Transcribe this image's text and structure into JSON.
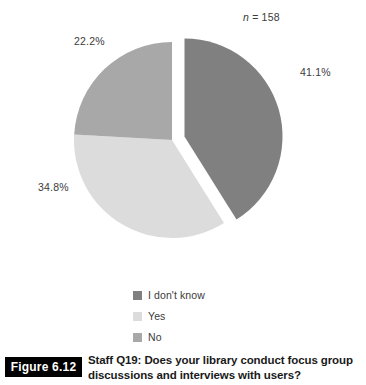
{
  "figure": {
    "tag_label": "Figure 6.12",
    "caption_line1": "Staff Q19: Does your library conduct focus group",
    "caption_line2": "discussions and interviews with users?"
  },
  "annotations": {
    "sample_size_prefix": "n",
    "sample_size_equals": "= 158",
    "sample_size_full": "n = 158"
  },
  "legend": {
    "items": [
      {
        "label": "I don't know",
        "color": "#808080"
      },
      {
        "label": "Yes",
        "color": "#dcdcdc"
      },
      {
        "label": "No",
        "color": "#a8a8a8"
      }
    ]
  },
  "labels": {
    "idk_pct": "41.1%",
    "yes_pct": "34.8%",
    "no_pct": "22.2%"
  },
  "chart_data": {
    "type": "pie",
    "title": "Staff Q19: Does your library conduct focus group discussions and interviews with users?",
    "subtitle": "n = 158",
    "sample_size": 158,
    "xlabel": "",
    "ylabel": "",
    "grid": false,
    "legend_position": "bottom",
    "start_angle_deg": 0,
    "direction": "clockwise",
    "exploded_slice": "I don't know",
    "explode_offset_px": 13,
    "center": {
      "x": 172,
      "y": 140
    },
    "radius": 98,
    "categories": [
      "I don't know",
      "Yes",
      "No"
    ],
    "values": [
      41.1,
      34.8,
      22.2
    ],
    "value_labels": [
      "41.1%",
      "34.8%",
      "22.2%"
    ],
    "colors": [
      "#808080",
      "#dcdcdc",
      "#a8a8a8"
    ],
    "slices": [
      {
        "name": "I don't know",
        "value": 41.1,
        "label": "41.1%",
        "color": "#808080",
        "start_deg": 0,
        "end_deg": 147.96,
        "exploded": true
      },
      {
        "name": "Yes",
        "value": 34.8,
        "label": "34.8%",
        "color": "#dcdcdc",
        "start_deg": 147.96,
        "end_deg": 273.24,
        "exploded": false
      },
      {
        "name": "No",
        "value": 22.2,
        "label": "22.2%",
        "color": "#a8a8a8",
        "start_deg": 273.24,
        "end_deg": 360,
        "exploded": false
      }
    ]
  }
}
